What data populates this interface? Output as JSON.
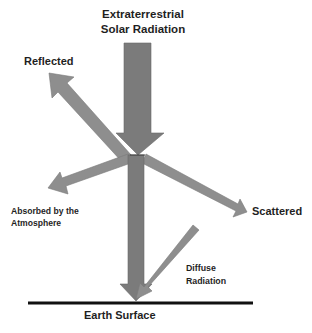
{
  "diagram": {
    "title_line1": "Extraterrestrial",
    "title_line2": "Solar Radiation",
    "labels": {
      "reflected": "Reflected",
      "absorbed_line1": "Absorbed by the",
      "absorbed_line2": "Atmosphere",
      "scattered": "Scattered",
      "diffuse_line1": "Diffuse",
      "diffuse_line2": "Radiation",
      "earth_surface": "Earth Surface"
    },
    "arrows": [
      {
        "name": "extraterrestrial-solar-radiation",
        "direction": "down",
        "from": "space",
        "to": "atmosphere"
      },
      {
        "name": "reflected",
        "direction": "up-left",
        "from": "atmosphere",
        "to": "space"
      },
      {
        "name": "absorbed-by-atmosphere",
        "direction": "down-left",
        "from": "atmosphere",
        "to": "atmosphere"
      },
      {
        "name": "scattered",
        "direction": "down-right",
        "from": "atmosphere",
        "to": "sky"
      },
      {
        "name": "direct-beam",
        "direction": "down",
        "from": "atmosphere",
        "to": "earth-surface"
      },
      {
        "name": "diffuse-radiation",
        "direction": "down-left",
        "from": "sky",
        "to": "earth-surface"
      }
    ],
    "colors": {
      "main_arrow": "#7b7b7b",
      "secondary_arrow": "#8e8e8e",
      "arrow_outline": "#6a6a6a",
      "ground_line": "#111111",
      "text": "#1f1f1f",
      "background": "#ffffff"
    }
  }
}
